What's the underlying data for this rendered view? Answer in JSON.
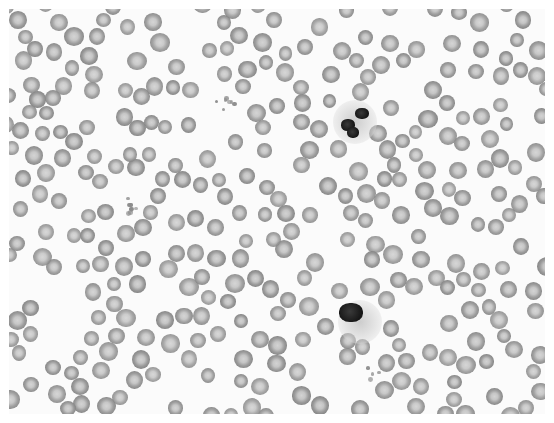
{
  "image": {
    "description": "Grayscale light-microscope image of a peripheral blood smear",
    "colors": {
      "background": "#fbfbfb",
      "rbc_ring": "#858585",
      "rbc_center": "#d2d2d2",
      "nucleus": "#161616",
      "border": "#ffffff"
    },
    "rbc_layout": {
      "seed": 7,
      "count": 330,
      "min_d": 14,
      "max_d": 19
    },
    "leukocytes": [
      {
        "type": "neutrophil",
        "cx": 355,
        "cy": 122,
        "lobes": [
          [
            348,
            125,
            14,
            12
          ],
          [
            362,
            113,
            14,
            11
          ],
          [
            353,
            132,
            12,
            11
          ]
        ]
      },
      {
        "type": "lymphocyte",
        "cx": 360,
        "cy": 322,
        "lobes": [
          [
            351,
            312,
            24,
            19
          ]
        ]
      }
    ],
    "platelet_clusters": [
      {
        "cx": 126,
        "cy": 205,
        "n": 10
      },
      {
        "cx": 223,
        "cy": 98,
        "n": 7
      },
      {
        "cx": 370,
        "cy": 372,
        "n": 4
      }
    ]
  }
}
